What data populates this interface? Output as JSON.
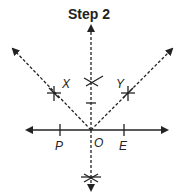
{
  "title": "Step 2",
  "colors": {
    "line": "#222222",
    "background": "#ffffff"
  },
  "labels": {
    "x": "X",
    "y": "Y",
    "o": "O",
    "p": "P",
    "e": "E"
  }
}
